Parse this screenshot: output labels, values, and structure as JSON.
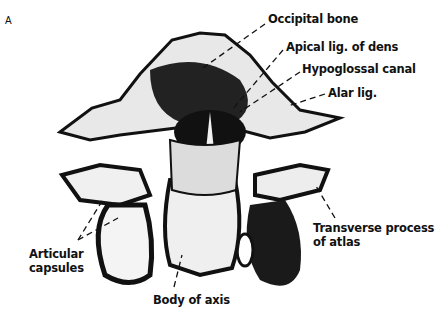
{
  "figure": {
    "panel_letter": "A",
    "colors": {
      "ink": "#111111",
      "background": "#ffffff"
    }
  },
  "labels": {
    "occipital_bone": "Occipital bone",
    "apical_lig": "Apical lig. of dens",
    "hypoglossal_canal": "Hypoglossal canal",
    "alar_lig": "Alar lig.",
    "transverse_process_line1": "Transverse process",
    "transverse_process_line2": "of atlas",
    "articular_capsules_line1": "Articular",
    "articular_capsules_line2": "capsules",
    "body_of_axis": "Body of axis"
  }
}
